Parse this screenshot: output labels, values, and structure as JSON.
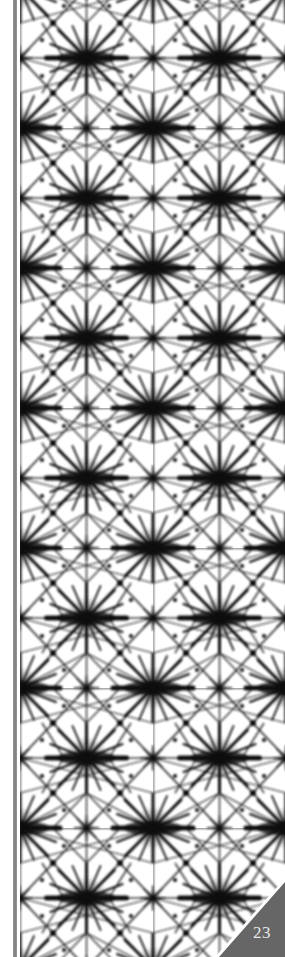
{
  "page": {
    "type": "book-page-decorative",
    "page_number": "23",
    "pattern_name": "shibori-tie-dye-star-grid",
    "colors": {
      "background": "#ffffff",
      "ink": "#111111",
      "spine_bar": "#8a8a8a",
      "corner_tab": "#666666",
      "page_number_text": "#e8e8e8"
    }
  }
}
